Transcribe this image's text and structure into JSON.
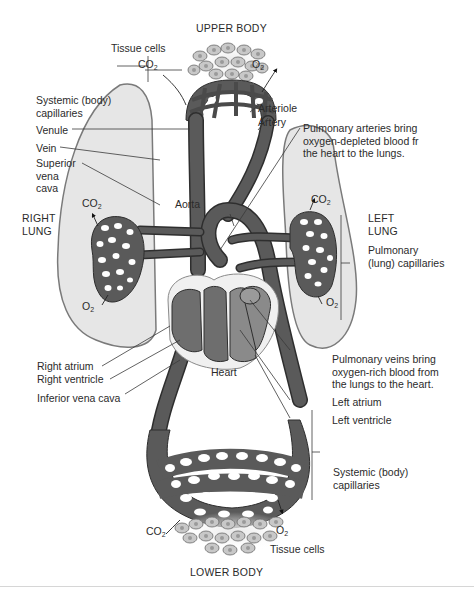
{
  "figure": {
    "title_top": "UPPER BODY",
    "title_bottom": "LOWER BODY",
    "colors": {
      "vessel": "#5a5a5a",
      "vessel_outline": "#2e2e2e",
      "lung_fill": "#e6e6e6",
      "lung_outline": "#7a7a7a",
      "heart_chamber": "#6e6e6e",
      "heart_pericardium": "#f0f0f0",
      "cell_fill": "#c8c8c8",
      "cell_nucleus": "#9a9a9a",
      "leader_line": "#3a3a3a"
    }
  },
  "labels": {
    "upper_tissue_cells": "Tissue cells",
    "upper_co2": "CO",
    "upper_o2": "O",
    "systemic_upper_line1": "Systemic (body)",
    "systemic_upper_line2": "capillaries",
    "venule": "Venule",
    "vein": "Vein",
    "superior_vena_cava_line1": "Superior",
    "superior_vena_cava_line2": "vena",
    "superior_vena_cava_line3": "cava",
    "right_lung_line1": "RIGHT",
    "right_lung_line2": "LUNG",
    "right_lung_co2": "CO",
    "right_lung_o2": "O",
    "aorta": "Aorta",
    "arteriole": "Arteriole",
    "artery": "Artery",
    "pulmonary_arteries_line1": "Pulmonary arteries bring",
    "pulmonary_arteries_line2": "oxygen-depleted blood fr",
    "pulmonary_arteries_line3": "the heart to the lungs.",
    "left_lung_line1": "LEFT",
    "left_lung_line2": "LUNG",
    "left_lung_co2": "CO",
    "left_lung_o2": "O",
    "pulmonary_capillaries_line1": "Pulmonary",
    "pulmonary_capillaries_line2": "(lung) capillaries",
    "right_atrium": "Right atrium",
    "right_ventricle": "Right ventricle",
    "inferior_vena_cava": "Inferior vena cava",
    "heart": "Heart",
    "pulmonary_veins_line1": "Pulmonary veins bring",
    "pulmonary_veins_line2": "oxygen-rich blood from",
    "pulmonary_veins_line3": "the lungs to the heart.",
    "left_atrium": "Left atrium",
    "left_ventricle": "Left ventricle",
    "systemic_lower_line1": "Systemic (body)",
    "systemic_lower_line2": "capillaries",
    "lower_co2": "CO",
    "lower_o2": "O",
    "lower_tissue_cells": "Tissue cells",
    "subscript_2": "2"
  }
}
